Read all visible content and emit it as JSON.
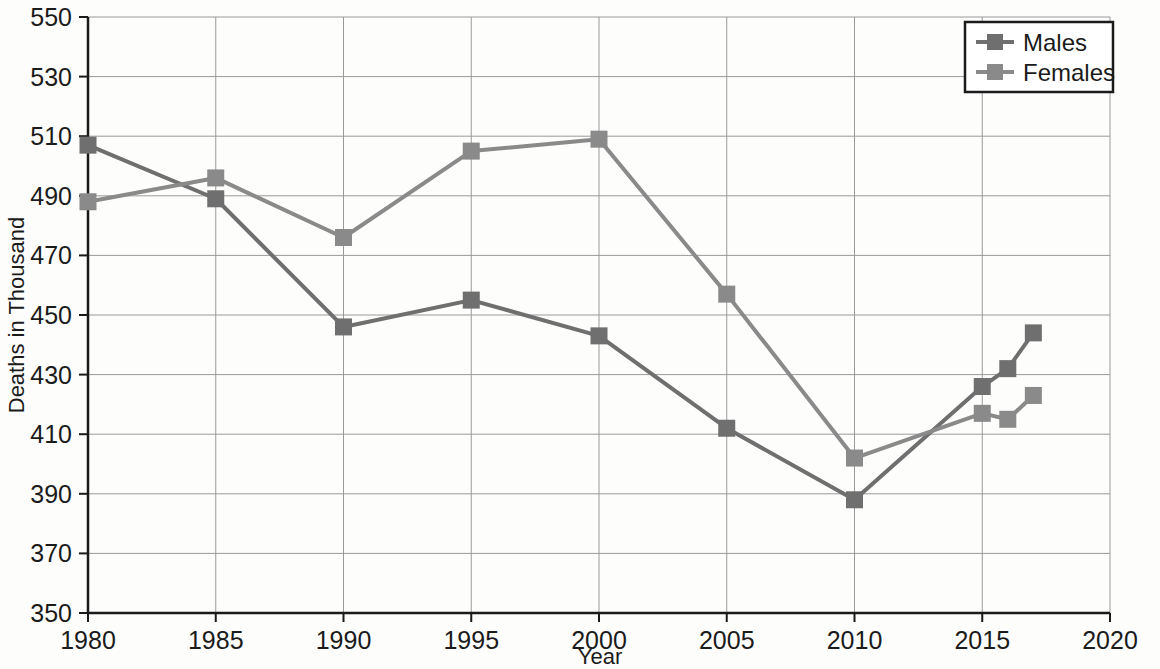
{
  "chart_data": {
    "type": "line",
    "title": "",
    "xlabel": "Year",
    "ylabel": "Deaths in Thousand",
    "xlim": [
      1980,
      2020
    ],
    "ylim": [
      350,
      550
    ],
    "xticks": [
      1980,
      1985,
      1990,
      1995,
      2000,
      2005,
      2010,
      2015,
      2020
    ],
    "yticks": [
      350,
      370,
      390,
      410,
      430,
      450,
      470,
      490,
      510,
      530,
      550
    ],
    "grid": true,
    "legend_position": "top-right",
    "series": [
      {
        "name": "Males",
        "color": "#6f6f6f",
        "marker": "square",
        "x": [
          1980,
          1985,
          1990,
          1995,
          2000,
          2005,
          2010,
          2015,
          2016,
          2017
        ],
        "values": [
          507,
          489,
          446,
          455,
          443,
          412,
          388,
          426,
          432,
          444
        ]
      },
      {
        "name": "Females",
        "color": "#8a8a8a",
        "marker": "square",
        "x": [
          1980,
          1985,
          1990,
          1995,
          2000,
          2005,
          2010,
          2015,
          2016,
          2017
        ],
        "values": [
          488,
          496,
          476,
          505,
          509,
          457,
          402,
          417,
          415,
          423
        ]
      }
    ]
  },
  "axis": {
    "y_title": "Deaths in Thousand",
    "x_title": "Year",
    "y_tick_labels": [
      "550",
      "530",
      "510",
      "490",
      "470",
      "450",
      "430",
      "410",
      "390",
      "370",
      "350"
    ],
    "x_tick_labels": [
      "1980",
      "1985",
      "1990",
      "1995",
      "2000",
      "2005",
      "2010",
      "2015",
      "2020"
    ]
  },
  "legend": {
    "items": [
      {
        "label": "Males"
      },
      {
        "label": "Females"
      }
    ]
  },
  "colors": {
    "males": "#6f6f6f",
    "females": "#8c8c8c",
    "grid": "#9a9a9a",
    "axis": "#1b1b1b",
    "background": "#fdfdfc"
  }
}
